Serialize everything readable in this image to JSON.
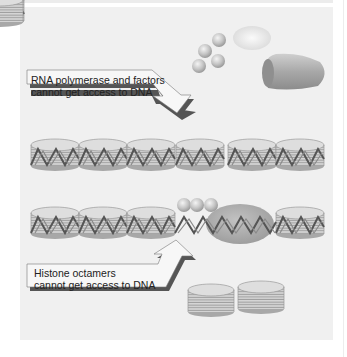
{
  "figure": {
    "labels": {
      "top_callout_line1": "RNA polymerase and factors",
      "top_callout_line2": "cannot get access to DNA",
      "bottom_callout_line1": "Histone octamers",
      "bottom_callout_line2": "cannot get access to DNA"
    },
    "elements": {
      "factor_spheres_top": 4,
      "rna_polymerase_shapes": 2,
      "nucleosome_row1_count": 6,
      "nucleosome_row2_count": 4,
      "factor_spheres_bound": 3,
      "free_histone_octamers": 2
    },
    "colors": {
      "panel_bg": "#f0f0f0",
      "callout_fill": "#f7f7f7",
      "callout_shadow": "#555555",
      "sphere": "#c8c8c8",
      "polymerase": "#a9a9a9",
      "histone_fill": "#dcdcdc",
      "dna": "#555555"
    }
  }
}
